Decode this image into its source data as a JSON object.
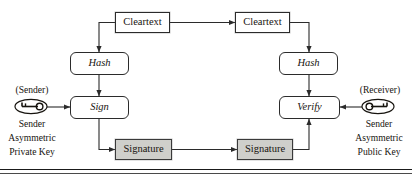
{
  "diagram": {
    "background_color": "#ffffff",
    "line_color": "#2b2b2b",
    "shaded_fill": "#cfcfcb",
    "nodes": {
      "cleartext_left": "Cleartext",
      "cleartext_right": "Cleartext",
      "hash_left": "Hash",
      "hash_right": "Hash",
      "sign": "Sign",
      "verify": "Verify",
      "signature_left": "Signature",
      "signature_right": "Signature"
    },
    "labels": {
      "sender_role": "(Sender)",
      "receiver_role": "(Receiver)",
      "sender_key_line1": "Sender",
      "sender_key_line2": "Asymmetric",
      "sender_key_line3": "Private Key",
      "receiver_key_line1": "Sender",
      "receiver_key_line2": "Asymmetric",
      "receiver_key_line3": "Public Key"
    },
    "icons": {
      "sender_key": "key-icon",
      "receiver_key": "key-icon"
    }
  }
}
